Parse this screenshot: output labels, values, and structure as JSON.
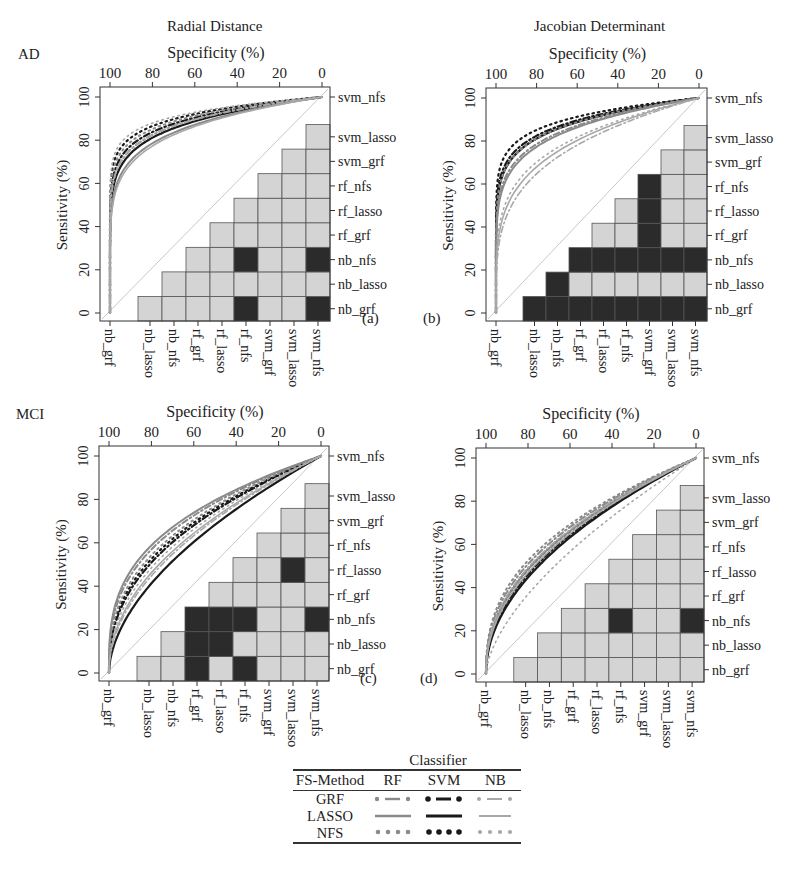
{
  "figure": {
    "column_titles": [
      "Radial Distance",
      "Jacobian Determinant"
    ],
    "row_labels": [
      "AD",
      "MCI"
    ],
    "x_axis_label": "Specificity (%)",
    "y_axis_label": "Sensitivity (%)",
    "x_ticks": [
      "100",
      "80",
      "60",
      "40",
      "20",
      "0"
    ],
    "y_ticks": [
      "0",
      "20",
      "40",
      "60",
      "80",
      "100"
    ],
    "matrix_row_labels_top_to_bottom": [
      "svm_nfs",
      "svm_lasso",
      "svm_grf",
      "rf_nfs",
      "rf_lasso",
      "rf_grf",
      "nb_nfs",
      "nb_lasso",
      "nb_grf"
    ],
    "matrix_col_labels": [
      "nb_grf",
      "nb_lasso",
      "nb_nfs",
      "rf_grf",
      "rf_lasso",
      "rf_nfs",
      "svm_grf",
      "svm_lasso",
      "svm_nfs"
    ],
    "panel_tags": [
      "(a)",
      "(b)",
      "(c)",
      "(d)"
    ]
  },
  "legend": {
    "title": "Classifier",
    "header": [
      "FS-Method",
      "RF",
      "SVM",
      "NB"
    ],
    "rows": [
      {
        "method": "GRF",
        "style": "dash-dot"
      },
      {
        "method": "LASSO",
        "style": "solid"
      },
      {
        "method": "NFS",
        "style": "dotted"
      }
    ],
    "colors": {
      "RF": "#8a8a8a",
      "SVM": "#1a1a1a",
      "NB": "#a8a8a8"
    }
  },
  "colors": {
    "significant_cell": "#2b2b2b",
    "nonsignificant_cell": "#d4d4d4",
    "diagonal": "#c8c8c8",
    "frame": "#333333"
  },
  "chart_data": [
    {
      "id": "a",
      "type": "line",
      "title": "Radial Distance — AD",
      "xlabel": "Specificity (%)",
      "ylabel": "Sensitivity (%)",
      "xlim": [
        100,
        0
      ],
      "ylim": [
        0,
        100
      ],
      "curve_shape": 0.13,
      "series": [
        {
          "name": "SVM-NFS",
          "classifier": "SVM",
          "fs": "NFS",
          "k": 0.09
        },
        {
          "name": "SVM-GRF",
          "classifier": "SVM",
          "fs": "GRF",
          "k": 0.11
        },
        {
          "name": "SVM-LASSO",
          "classifier": "SVM",
          "fs": "LASSO",
          "k": 0.13
        },
        {
          "name": "RF-NFS",
          "classifier": "RF",
          "fs": "NFS",
          "k": 0.1
        },
        {
          "name": "RF-GRF",
          "classifier": "RF",
          "fs": "GRF",
          "k": 0.12
        },
        {
          "name": "RF-LASSO",
          "classifier": "RF",
          "fs": "LASSO",
          "k": 0.15
        },
        {
          "name": "NB-NFS",
          "classifier": "NB",
          "fs": "NFS",
          "k": 0.08
        },
        {
          "name": "NB-GRF",
          "classifier": "NB",
          "fs": "GRF",
          "k": 0.12
        },
        {
          "name": "NB-LASSO",
          "classifier": "NB",
          "fs": "LASSO",
          "k": 0.16
        }
      ],
      "significance_matrix": {
        "note": "upper triangle; rows/cols ordered nb_grf..svm_nfs; 1 = significant (dark)",
        "cells": [
          [
            0,
            0,
            0,
            0,
            0,
            1,
            0,
            0,
            1
          ],
          [
            0,
            0,
            0,
            0,
            0,
            0,
            0,
            0,
            0
          ],
          [
            0,
            0,
            0,
            0,
            0,
            1,
            0,
            0,
            1
          ],
          [
            0,
            0,
            0,
            0,
            0,
            0,
            0,
            0,
            0
          ],
          [
            0,
            0,
            0,
            0,
            0,
            0,
            0,
            0,
            0
          ],
          [
            0,
            0,
            0,
            0,
            0,
            0,
            0,
            0,
            0
          ],
          [
            0,
            0,
            0,
            0,
            0,
            0,
            0,
            0,
            0
          ],
          [
            0,
            0,
            0,
            0,
            0,
            0,
            0,
            0,
            0
          ],
          [
            0,
            0,
            0,
            0,
            0,
            0,
            0,
            0,
            0
          ]
        ]
      }
    },
    {
      "id": "b",
      "type": "line",
      "title": "Jacobian Determinant — AD",
      "xlabel": "Specificity (%)",
      "ylabel": "Sensitivity (%)",
      "xlim": [
        100,
        0
      ],
      "ylim": [
        0,
        100
      ],
      "series": [
        {
          "name": "SVM-NFS",
          "classifier": "SVM",
          "fs": "NFS",
          "k": 0.1
        },
        {
          "name": "SVM-GRF",
          "classifier": "SVM",
          "fs": "GRF",
          "k": 0.12
        },
        {
          "name": "SVM-LASSO",
          "classifier": "SVM",
          "fs": "LASSO",
          "k": 0.13
        },
        {
          "name": "RF-NFS",
          "classifier": "RF",
          "fs": "NFS",
          "k": 0.13
        },
        {
          "name": "RF-GRF",
          "classifier": "RF",
          "fs": "GRF",
          "k": 0.15
        },
        {
          "name": "RF-LASSO",
          "classifier": "RF",
          "fs": "LASSO",
          "k": 0.16
        },
        {
          "name": "NB-NFS",
          "classifier": "NB",
          "fs": "NFS",
          "k": 0.22
        },
        {
          "name": "NB-GRF",
          "classifier": "NB",
          "fs": "GRF",
          "k": 0.27
        },
        {
          "name": "NB-LASSO",
          "classifier": "NB",
          "fs": "LASSO",
          "k": 0.24
        }
      ],
      "significance_matrix": {
        "note": "upper triangle; rows/cols ordered nb_grf..svm_nfs; 1 = significant (dark)",
        "cells": [
          [
            0,
            1,
            1,
            1,
            1,
            1,
            1,
            1,
            1
          ],
          [
            0,
            0,
            1,
            0,
            0,
            0,
            0,
            0,
            0
          ],
          [
            0,
            0,
            0,
            1,
            1,
            1,
            1,
            1,
            1
          ],
          [
            0,
            0,
            0,
            0,
            0,
            0,
            1,
            0,
            0
          ],
          [
            0,
            0,
            0,
            0,
            0,
            0,
            1,
            0,
            0
          ],
          [
            0,
            0,
            0,
            0,
            0,
            0,
            1,
            0,
            0
          ],
          [
            0,
            0,
            0,
            0,
            0,
            0,
            0,
            0,
            0
          ],
          [
            0,
            0,
            0,
            0,
            0,
            0,
            0,
            0,
            0
          ],
          [
            0,
            0,
            0,
            0,
            0,
            0,
            0,
            0,
            0
          ]
        ]
      }
    },
    {
      "id": "c",
      "type": "line",
      "title": "Radial Distance — MCI",
      "xlabel": "Specificity (%)",
      "ylabel": "Sensitivity (%)",
      "xlim": [
        100,
        0
      ],
      "ylim": [
        0,
        100
      ],
      "series": [
        {
          "name": "SVM-NFS",
          "classifier": "SVM",
          "fs": "NFS",
          "k": 0.4
        },
        {
          "name": "SVM-GRF",
          "classifier": "SVM",
          "fs": "GRF",
          "k": 0.42
        },
        {
          "name": "SVM-LASSO",
          "classifier": "SVM",
          "fs": "LASSO",
          "k": 0.55
        },
        {
          "name": "RF-NFS",
          "classifier": "RF",
          "fs": "NFS",
          "k": 0.38
        },
        {
          "name": "RF-GRF",
          "classifier": "RF",
          "fs": "GRF",
          "k": 0.35
        },
        {
          "name": "RF-LASSO",
          "classifier": "RF",
          "fs": "LASSO",
          "k": 0.33
        },
        {
          "name": "NB-NFS",
          "classifier": "NB",
          "fs": "NFS",
          "k": 0.45
        },
        {
          "name": "NB-GRF",
          "classifier": "NB",
          "fs": "GRF",
          "k": 0.5
        },
        {
          "name": "NB-LASSO",
          "classifier": "NB",
          "fs": "LASSO",
          "k": 0.48
        }
      ],
      "significance_matrix": {
        "note": "upper triangle; rows/cols ordered nb_grf..svm_nfs; 1 = significant (dark)",
        "cells": [
          [
            0,
            0,
            0,
            1,
            0,
            1,
            0,
            0,
            0
          ],
          [
            0,
            0,
            0,
            1,
            1,
            0,
            0,
            0,
            0
          ],
          [
            0,
            0,
            0,
            1,
            1,
            1,
            0,
            0,
            1
          ],
          [
            0,
            0,
            0,
            0,
            0,
            0,
            0,
            0,
            0
          ],
          [
            0,
            0,
            0,
            0,
            0,
            0,
            0,
            1,
            0
          ],
          [
            0,
            0,
            0,
            0,
            0,
            0,
            0,
            0,
            0
          ],
          [
            0,
            0,
            0,
            0,
            0,
            0,
            0,
            0,
            0
          ],
          [
            0,
            0,
            0,
            0,
            0,
            0,
            0,
            0,
            0
          ],
          [
            0,
            0,
            0,
            0,
            0,
            0,
            0,
            0,
            0
          ]
        ]
      }
    },
    {
      "id": "d",
      "type": "line",
      "title": "Jacobian Determinant — MCI",
      "xlabel": "Specificity (%)",
      "ylabel": "Sensitivity (%)",
      "xlim": [
        100,
        0
      ],
      "ylim": [
        0,
        100
      ],
      "series": [
        {
          "name": "SVM-NFS",
          "classifier": "SVM",
          "fs": "NFS",
          "k": 0.45
        },
        {
          "name": "SVM-GRF",
          "classifier": "SVM",
          "fs": "GRF",
          "k": 0.48
        },
        {
          "name": "SVM-LASSO",
          "classifier": "SVM",
          "fs": "LASSO",
          "k": 0.5
        },
        {
          "name": "RF-NFS",
          "classifier": "RF",
          "fs": "NFS",
          "k": 0.4
        },
        {
          "name": "RF-GRF",
          "classifier": "RF",
          "fs": "GRF",
          "k": 0.42
        },
        {
          "name": "RF-LASSO",
          "classifier": "RF",
          "fs": "LASSO",
          "k": 0.45
        },
        {
          "name": "NB-NFS",
          "classifier": "NB",
          "fs": "NFS",
          "k": 0.62
        },
        {
          "name": "NB-GRF",
          "classifier": "NB",
          "fs": "GRF",
          "k": 0.44
        },
        {
          "name": "NB-LASSO",
          "classifier": "NB",
          "fs": "LASSO",
          "k": 0.47
        }
      ],
      "significance_matrix": {
        "note": "upper triangle; rows/cols ordered nb_grf..svm_nfs; 1 = significant (dark)",
        "cells": [
          [
            0,
            0,
            0,
            0,
            0,
            0,
            0,
            0,
            0
          ],
          [
            0,
            0,
            0,
            0,
            0,
            0,
            0,
            0,
            0
          ],
          [
            0,
            0,
            0,
            0,
            0,
            1,
            0,
            0,
            1
          ],
          [
            0,
            0,
            0,
            0,
            0,
            0,
            0,
            0,
            0
          ],
          [
            0,
            0,
            0,
            0,
            0,
            0,
            0,
            0,
            0
          ],
          [
            0,
            0,
            0,
            0,
            0,
            0,
            0,
            0,
            0
          ],
          [
            0,
            0,
            0,
            0,
            0,
            0,
            0,
            0,
            0
          ],
          [
            0,
            0,
            0,
            0,
            0,
            0,
            0,
            0,
            0
          ],
          [
            0,
            0,
            0,
            0,
            0,
            0,
            0,
            0,
            0
          ]
        ]
      }
    }
  ]
}
